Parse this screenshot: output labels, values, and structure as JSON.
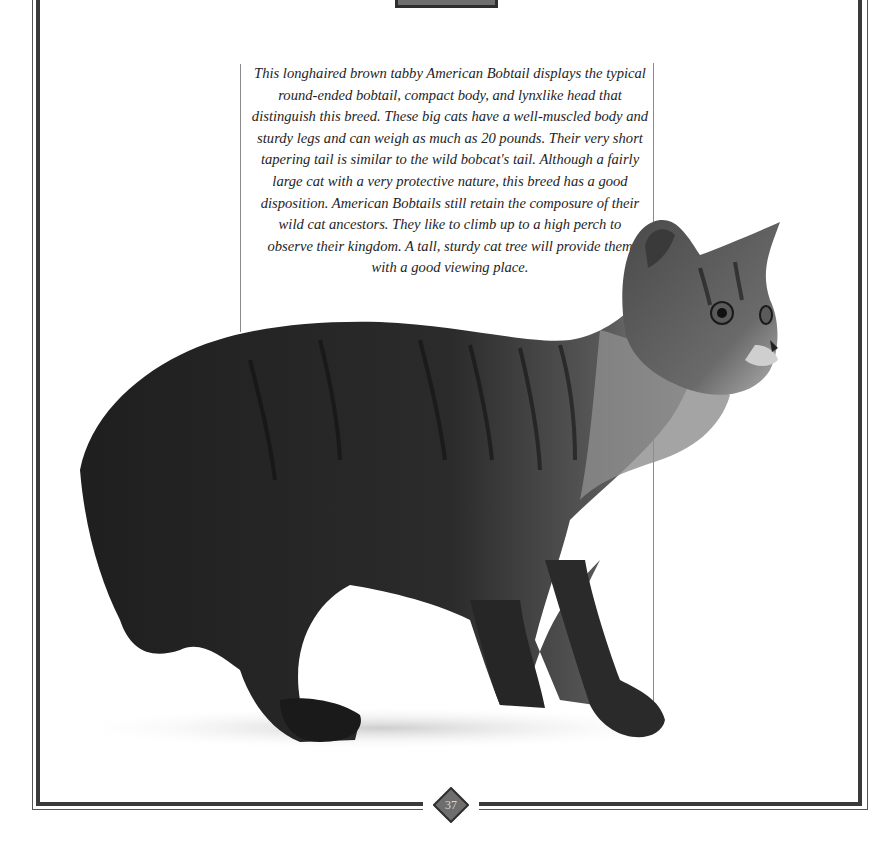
{
  "page": {
    "type": "book-page-scan",
    "page_number": "37"
  },
  "caption": {
    "lines": [
      "This longhaired brown tabby American Bobtail displays the typical",
      "round-ended bobtail, compact body, and lynxlike head that",
      "distinguish this breed. These big cats have a well-muscled body and",
      "sturdy legs and can weigh as much as 20 pounds. Their very short",
      "tapering tail is similar to the wild bobcat's tail. Although a fairly",
      "large cat with a very protective nature, this breed has a good",
      "disposition. American Bobtails still retain the composure of their",
      "wild cat ancestors. They like to climb up to a high perch to",
      "observe their kingdom. A tall, sturdy cat tree will provide them",
      "with a good viewing place."
    ]
  },
  "photo": {
    "description": "Longhaired brown tabby American Bobtail standing, facing right, on white background",
    "icon": "cat-photo"
  },
  "colors": {
    "frame": "#3a3a3a",
    "badge_fill": "#6e6e6e",
    "text": "#1e1e1e",
    "background": "#ffffff"
  }
}
